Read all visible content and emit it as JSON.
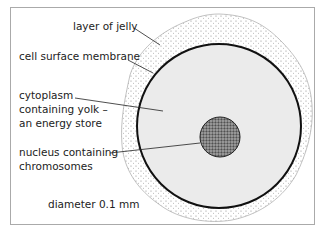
{
  "labels": {
    "jelly": "layer of jelly",
    "membrane": "cell surface membrane",
    "cytoplasm_1": "cytoplasm",
    "cytoplasm_2": "containing yolk –",
    "cytoplasm_3": "an energy store",
    "nucleus_1": "nucleus containing",
    "nucleus_2": "chromosomes",
    "diameter": "diameter 0.1 mm"
  }
}
